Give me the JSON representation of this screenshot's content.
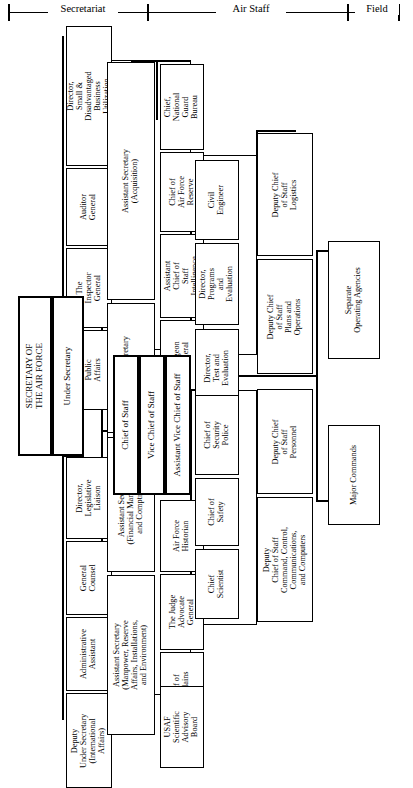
{
  "chart_title": "Department of the Air Force Organization Chart",
  "ruler": {
    "segments": [
      {
        "label": "Secretariat"
      },
      {
        "label": "Air Staff"
      },
      {
        "label": "Field"
      }
    ]
  },
  "head": {
    "secretary": "SECRETARY OF\nTHE AIR FORCE",
    "under_secretary": "Under Secretary",
    "chief_of_staff": "Chief of Staff",
    "vice_chief_of_staff": "Vice Chief of Staff",
    "assistant_vice_chief_of_staff": "Assistant Vice Chief of Staff"
  },
  "secretariat": {
    "staff_offices": [
      {
        "label": "Director,\nSmall &\nDisadvantaged\nBusiness\nUtilization"
      },
      {
        "label": "Auditor\nGeneral"
      },
      {
        "label": "The\nInspector\nGeneral"
      },
      {
        "label": "Director,\nPublic\nAffairs"
      },
      {
        "label": "Director,\nLegislative\nLiaison"
      },
      {
        "label": "General\nCounsel"
      },
      {
        "label": "Administrative\nAssistant"
      },
      {
        "label": "Deputy\nUnder Secretary\n(International\nAffairs)"
      }
    ],
    "assistant_secretaries": [
      {
        "label": "Assistant Secretary\n(Acquisition)"
      },
      {
        "label": "Assistant Secretary\n(Space)"
      },
      {
        "label": "Assistant Secretary\n(Financial Management\nand Comptroller)"
      },
      {
        "label": "Assistant Secretary\n(Manpower, Reserve\nAffairs, Installations,\nand Environment)"
      }
    ]
  },
  "air_staff": {
    "special_staff": [
      {
        "label": "Chief,\nNational\nGuard\nBureau"
      },
      {
        "label": "Chief of\nAir Force\nReserve"
      },
      {
        "label": "Assistant\nChief of\nStaff\nIntelligence"
      },
      {
        "label": "Surgeon\nGeneral"
      }
    ],
    "support_staff": [
      {
        "label": "Air Force\nHistorian"
      },
      {
        "label": "The Judge\nAdvocate\nGeneral"
      },
      {
        "label": "Chief of\nChaplains"
      },
      {
        "label": "USAF\nScientific\nAdvisory\nBoard"
      }
    ],
    "directorates": [
      {
        "label": "Civil\nEngineer"
      },
      {
        "label": "Director,\nPrograms\nand\nEvaluation"
      },
      {
        "label": "Director,\nTest and\nEvaluation"
      }
    ],
    "chiefs": [
      {
        "label": "Chief of\nSecurity\nPolice"
      },
      {
        "label": "Chief of\nSafety"
      },
      {
        "label": "Chief\nScientist"
      }
    ],
    "deputy_chiefs_of_staff": [
      {
        "label": "Deputy Chief\nof Staff\nLogistics"
      },
      {
        "label": "Deputy Chief\nof Staff\nPlans and\nOperations"
      },
      {
        "label": "Deputy Chief\nof Staff\nPersonnel"
      },
      {
        "label": "Deputy\nChief of Staff\nCommand, Control,\nCommunications,\nand Computers"
      }
    ]
  },
  "field": {
    "units": [
      {
        "label": "Separate\nOperating Agencies"
      },
      {
        "label": "Major Commands"
      }
    ]
  }
}
